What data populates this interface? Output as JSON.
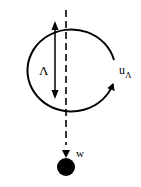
{
  "diagram": {
    "labels": {
      "length": "Λ",
      "velocity_main": "u",
      "velocity_sub": "Λ",
      "weight": "w"
    },
    "colors": {
      "stroke": "#000000",
      "background": "#ffffff"
    }
  }
}
